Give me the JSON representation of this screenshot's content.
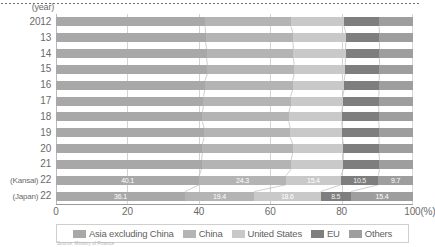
{
  "axis": {
    "year_label": "(year)",
    "x_ticks": [
      "0",
      "20",
      "40",
      "60",
      "80",
      "100(%)"
    ],
    "x_tick_values": [
      0,
      20,
      40,
      60,
      80,
      100
    ]
  },
  "legend": {
    "items": [
      {
        "label": "Asia excluding China",
        "color": "#a8a8a8"
      },
      {
        "label": "China",
        "color": "#b4b4b4"
      },
      {
        "label": "United States",
        "color": "#c9c9c9"
      },
      {
        "label": "EU",
        "color": "#7e7e7e"
      },
      {
        "label": "Others",
        "color": "#9e9e9e"
      }
    ]
  },
  "source_note": "Source: Ministry of Finance",
  "chart_data": {
    "type": "bar",
    "orientation": "horizontal",
    "stacked": true,
    "normalized": true,
    "title": "",
    "xlabel": "(%)",
    "ylabel": "(year)",
    "xlim": [
      0,
      100
    ],
    "grid": true,
    "legend_position": "bottom",
    "categories": [
      "2012",
      "13",
      "14",
      "15",
      "16",
      "17",
      "18",
      "19",
      "20",
      "21",
      "(Kansai) 22",
      "(Japan) 22"
    ],
    "category_prefixes": [
      "",
      "",
      "",
      "",
      "",
      "",
      "",
      "",
      "",
      "",
      "(Kansai)",
      "(Japan)"
    ],
    "category_values": [
      "2012",
      "13",
      "14",
      "15",
      "16",
      "17",
      "18",
      "19",
      "20",
      "21",
      "22",
      "22"
    ],
    "series": [
      {
        "name": "Asia excluding China",
        "color": "#a8a8a8",
        "values": [
          41.8,
          41.9,
          42.2,
          42.4,
          41.7,
          41.3,
          41.0,
          41.5,
          41.0,
          40.8,
          40.1,
          36.1
        ]
      },
      {
        "name": "China",
        "color": "#b4b4b4",
        "values": [
          24.0,
          24.5,
          24.3,
          24.3,
          24.6,
          24.4,
          24.2,
          24.1,
          25.3,
          25.1,
          24.3,
          19.4
        ]
      },
      {
        "name": "United States",
        "color": "#c9c9c9",
        "values": [
          14.9,
          14.8,
          14.6,
          14.3,
          14.4,
          14.6,
          14.8,
          14.6,
          14.2,
          14.6,
          15.4,
          18.6
        ]
      },
      {
        "name": "EU",
        "color": "#7e7e7e",
        "values": [
          9.8,
          9.4,
          9.5,
          9.6,
          9.8,
          10.1,
          10.4,
          10.3,
          10.0,
          10.1,
          10.5,
          8.5
        ]
      },
      {
        "name": "Others",
        "color": "#9e9e9e",
        "values": [
          9.5,
          9.4,
          9.4,
          9.4,
          9.5,
          9.6,
          9.6,
          9.5,
          9.5,
          9.4,
          9.7,
          17.4
        ]
      }
    ],
    "data_labels": {
      "rows": [
        {
          "category": "(Kansai) 22",
          "labels": [
            "40.1",
            "24.3",
            "15.4",
            "10.5",
            "9.7"
          ]
        },
        {
          "category": "(Japan) 22",
          "labels": [
            "36.1",
            "19.4",
            "18.6",
            "8.5",
            "15.4"
          ]
        }
      ]
    }
  }
}
